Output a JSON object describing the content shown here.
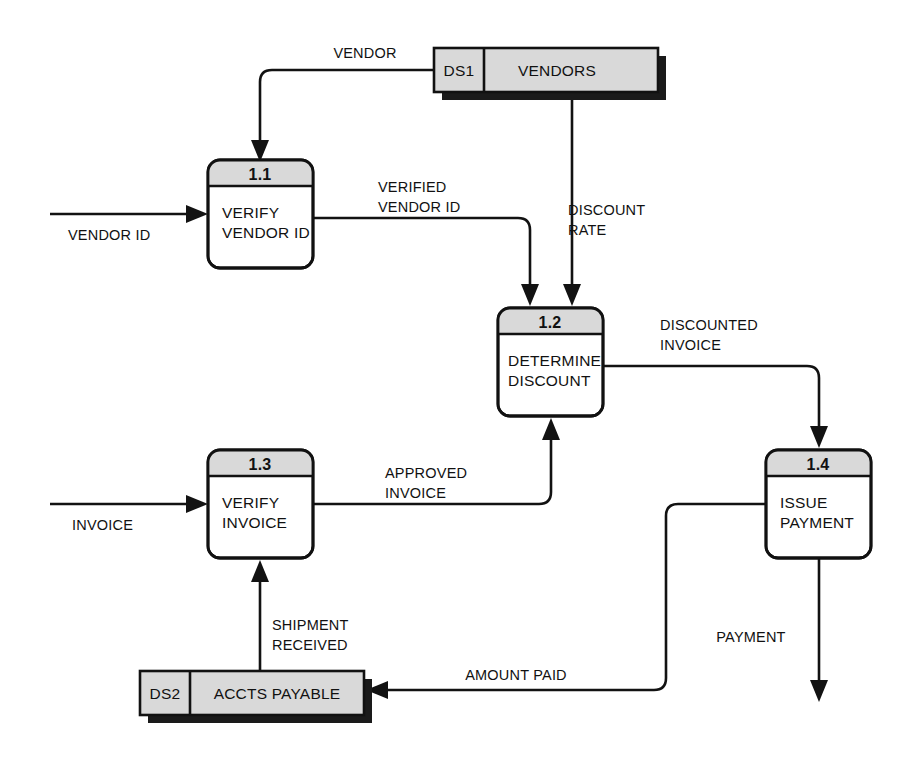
{
  "diagram": {
    "type": "data-flow-diagram",
    "processes": [
      {
        "id": "1.1",
        "number": "1.1",
        "label_lines": [
          "VERIFY",
          "VENDOR ID"
        ],
        "x": 208,
        "y": 160,
        "width": 105,
        "height": 108
      },
      {
        "id": "1.2",
        "number": "1.2",
        "label_lines": [
          "DETERMINE",
          "DISCOUNT"
        ],
        "x": 498,
        "y": 308,
        "width": 105,
        "height": 108
      },
      {
        "id": "1.3",
        "number": "1.3",
        "label_lines": [
          "VERIFY",
          "INVOICE"
        ],
        "x": 208,
        "y": 450,
        "width": 105,
        "height": 108
      },
      {
        "id": "1.4",
        "number": "1.4",
        "label_lines": [
          "ISSUE",
          "PAYMENT"
        ],
        "x": 766,
        "y": 450,
        "width": 105,
        "height": 108
      }
    ],
    "data_stores": [
      {
        "id": "DS1",
        "name": "VENDORS",
        "x": 434,
        "y": 48,
        "width": 224,
        "height": 44,
        "id_cell_width": 50
      },
      {
        "id": "DS2",
        "name": "ACCTS PAYABLE",
        "x": 140,
        "y": 671,
        "width": 224,
        "height": 44,
        "id_cell_width": 50
      }
    ],
    "flows": [
      {
        "name": "vendor",
        "label_lines": [
          "VENDOR"
        ],
        "from": "DS1",
        "to": "1.1"
      },
      {
        "name": "vendor-id",
        "label_lines": [
          "VENDOR ID"
        ],
        "from": "external",
        "to": "1.1"
      },
      {
        "name": "verified-vendor-id",
        "label_lines": [
          "VERIFIED",
          "VENDOR ID"
        ],
        "from": "1.1",
        "to": "1.2"
      },
      {
        "name": "discount-rate",
        "label_lines": [
          "DISCOUNT",
          "RATE"
        ],
        "from": "DS1",
        "to": "1.2"
      },
      {
        "name": "discounted-invoice",
        "label_lines": [
          "DISCOUNTED",
          "INVOICE"
        ],
        "from": "1.2",
        "to": "1.4"
      },
      {
        "name": "invoice",
        "label_lines": [
          "INVOICE"
        ],
        "from": "external",
        "to": "1.3"
      },
      {
        "name": "approved-invoice",
        "label_lines": [
          "APPROVED",
          "INVOICE"
        ],
        "from": "1.3",
        "to": "1.2"
      },
      {
        "name": "shipment-received",
        "label_lines": [
          "SHIPMENT",
          "RECEIVED"
        ],
        "from": "DS2",
        "to": "1.3"
      },
      {
        "name": "amount-paid",
        "label_lines": [
          "AMOUNT PAID"
        ],
        "from": "1.4",
        "to": "DS2"
      },
      {
        "name": "payment",
        "label_lines": [
          "PAYMENT"
        ],
        "from": "1.4",
        "to": "external"
      }
    ],
    "colors": {
      "line": "#121212",
      "store_fill": "#d9d9d9",
      "process_header_fill": "#d9d9d9",
      "process_body_fill": "#ffffff",
      "shadow": "#1a1a1a",
      "background": "#ffffff"
    }
  },
  "labels": {
    "vendor": "VENDOR",
    "vendor_id": "VENDOR ID",
    "verified_1": "VERIFIED",
    "verified_2": "VENDOR ID",
    "discount_rate_1": "DISCOUNT",
    "discount_rate_2": "RATE",
    "discounted_invoice_1": "DISCOUNTED",
    "discounted_invoice_2": "INVOICE",
    "invoice": "INVOICE",
    "approved_1": "APPROVED",
    "approved_2": "INVOICE",
    "shipment_1": "SHIPMENT",
    "shipment_2": "RECEIVED",
    "amount_paid": "AMOUNT PAID",
    "payment": "PAYMENT"
  },
  "processes": {
    "p11": {
      "num": "1.1",
      "l1": "VERIFY",
      "l2": "VENDOR ID"
    },
    "p12": {
      "num": "1.2",
      "l1": "DETERMINE",
      "l2": "DISCOUNT"
    },
    "p13": {
      "num": "1.3",
      "l1": "VERIFY",
      "l2": "INVOICE"
    },
    "p14": {
      "num": "1.4",
      "l1": "ISSUE",
      "l2": "PAYMENT"
    }
  },
  "stores": {
    "ds1": {
      "id": "DS1",
      "name": "VENDORS"
    },
    "ds2": {
      "id": "DS2",
      "name": "ACCTS PAYABLE"
    }
  }
}
